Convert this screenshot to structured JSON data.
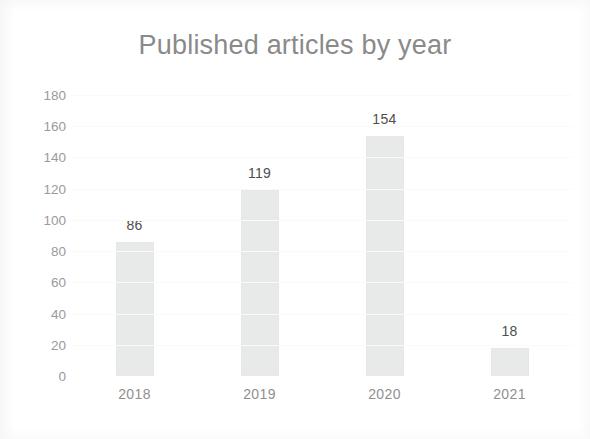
{
  "chart_data": {
    "type": "bar",
    "title": "Published articles by year",
    "categories": [
      "2018",
      "2019",
      "2020",
      "2021"
    ],
    "values": [
      86,
      119,
      154,
      18
    ],
    "value_labels": [
      "86",
      "119",
      "154",
      "18"
    ],
    "xlabel": "",
    "ylabel": "",
    "ylim": [
      0,
      180
    ],
    "ytick_labels": [
      "180",
      "160",
      "140",
      "120",
      "100",
      "80",
      "60",
      "40",
      "20",
      "0"
    ],
    "ytick_values": [
      180,
      160,
      140,
      120,
      100,
      80,
      60,
      40,
      20,
      0
    ],
    "ytick_step": 20,
    "grid": false,
    "legend": "none",
    "series": [
      {
        "name": "Published articles",
        "values": [
          86,
          119,
          154,
          18
        ]
      }
    ],
    "colors": {
      "bar_fill": "#e8e9e9",
      "title_text": "#8a8a8a",
      "axis_text": "#9a9a9a",
      "value_label_text": "#4e4e4e",
      "background": "#ffffff"
    }
  }
}
